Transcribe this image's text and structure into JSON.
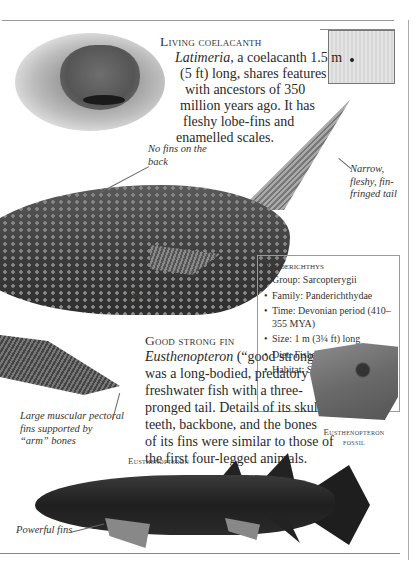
{
  "coelacanth": {
    "title": "Living coelacanth",
    "body_italic": "Latimeria",
    "body_rest_lines": [
      ", a coelacanth 1.5 m",
      "(5 ft) long, shares features",
      "with ancestors of 350",
      "million years ago. It has",
      "fleshy lobe-fins and",
      "enamelled scales."
    ]
  },
  "annotations": {
    "no_fins": [
      "No fins on the",
      "back"
    ],
    "tail": [
      "Narrow,",
      "fleshy, fin-",
      "fringed tail"
    ],
    "pectoral": [
      "Large muscular pectoral",
      "fins supported by",
      "“arm” bones"
    ],
    "powerful_fins": "Powerful fins"
  },
  "labels": {
    "panderichthys": "Panderichthys",
    "fossil": [
      "Eusthenopteron",
      "fossil"
    ],
    "eusthenopteron": "Eusthenopteron"
  },
  "infobox": {
    "title": "Panderichthys",
    "items": [
      "Group: Sarcopterygii",
      "Family: Panderichthydae",
      "Time: Devonian period (410–355 MYA)",
      "Size: 1 m (3¼ ft) long",
      "Diet: Fishes and crustaceans",
      "Habitat: Shallow pools"
    ]
  },
  "good_strong_fin": {
    "title": "Good strong fin",
    "body_italic": "Eusthenopteron",
    "body_rest_lines": [
      " (“good strong fin”)",
      "was a long-bodied, predatory",
      "freshwater fish with a three-",
      "pronged tail. Details of its skull,",
      "teeth, backbone, and the bones",
      "of its fins were similar to those of",
      "the first four-legged animals."
    ]
  }
}
